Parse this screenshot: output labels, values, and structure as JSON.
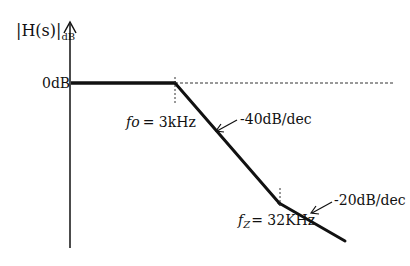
{
  "diagram": {
    "type": "bode-magnitude-asymptote",
    "y_axis_label": "|H(s)|",
    "y_axis_subscript": "dB",
    "zero_level_label": "0dB",
    "breakpoints": [
      {
        "symbol": "fo",
        "symbol_main": "f",
        "symbol_sub": "o",
        "value": "= 3kHz"
      },
      {
        "symbol": "fz",
        "symbol_main": "f",
        "symbol_sub": "Z",
        "value": "= 32KHz"
      }
    ],
    "slopes": [
      {
        "label": "-40dB/dec"
      },
      {
        "label": "-20dB/dec"
      }
    ],
    "colors": {
      "line": "#111111",
      "dashed": "#333333"
    }
  }
}
